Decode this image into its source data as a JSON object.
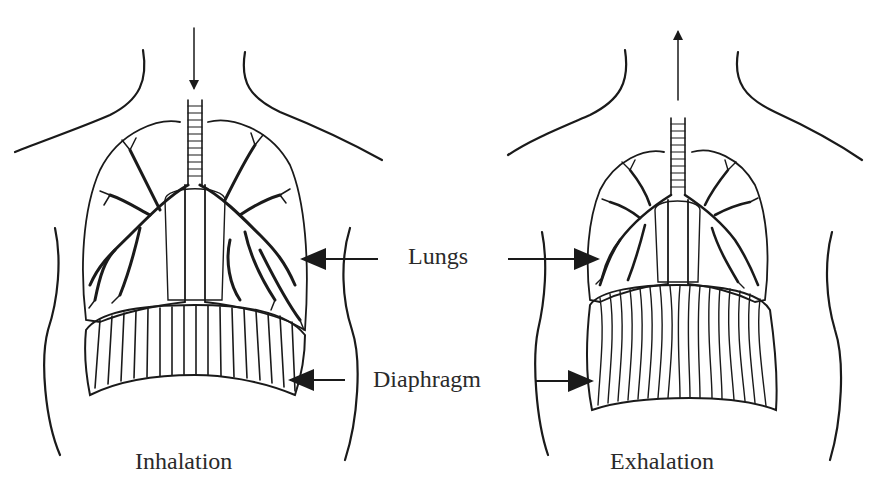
{
  "labels": {
    "lungs": "Lungs",
    "diaphragm": "Diaphragm",
    "inhalation": "Inhalation",
    "exhalation": "Exhalation"
  },
  "panels": [
    {
      "name": "inhalation",
      "airflow": "down",
      "lungs_state": "expanded",
      "diaphragm_state": "flattened"
    },
    {
      "name": "exhalation",
      "airflow": "up",
      "lungs_state": "contracted",
      "diaphragm_state": "domed"
    }
  ],
  "colors": {
    "ink": "#1a1a1a",
    "background": "#ffffff"
  }
}
